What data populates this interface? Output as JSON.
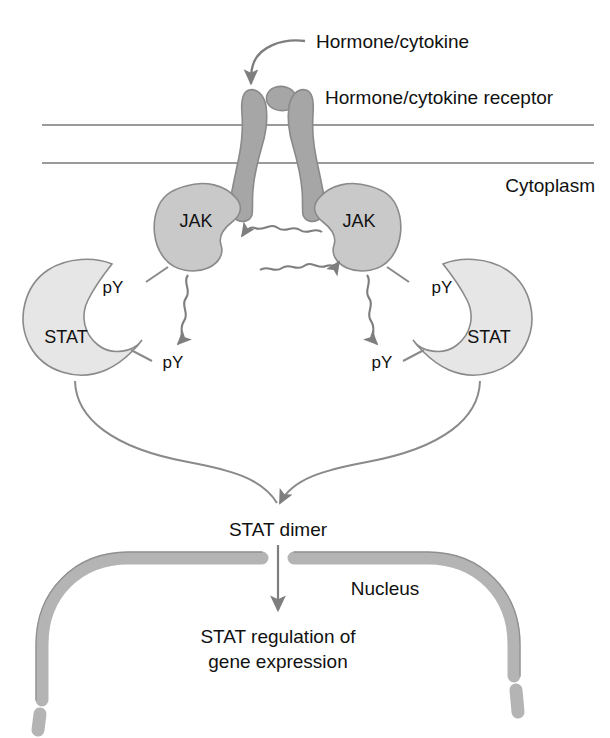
{
  "figure": {
    "background_color": "#ffffff"
  },
  "labels": {
    "ligand": "Hormone/cytokine",
    "receptor": "Hormone/cytokine receptor",
    "cytoplasm": "Cytoplasm",
    "nucleus": "Nucleus",
    "stat_dimer": "STAT dimer",
    "gene_expression_line1": "STAT regulation of",
    "gene_expression_line2": "gene expression"
  },
  "shapes": {
    "jak_left_label": "JAK",
    "jak_right_label": "JAK",
    "stat_left_label": "STAT",
    "stat_right_label": "STAT"
  },
  "phospho": {
    "jak_left_py": "pY",
    "stat_left_py": "pY",
    "jak_right_py": "pY",
    "stat_right_py": "pY"
  },
  "colors": {
    "receptor_fill": "#a6a6a6",
    "ligand_fill": "#a6a6a6",
    "jak_fill": "#c9c9c9",
    "stat_fill": "#e6e6e6",
    "nucleus_fill": "#b4b4b4",
    "outline": "#8a8a8a",
    "membrane": "#9a9a9a",
    "arrow": "#7e7e7e",
    "text": "#111111"
  },
  "geometry": {
    "canvas_width": 610,
    "canvas_height": 738,
    "membrane_line_top_y": 125,
    "membrane_line_bottom_y": 163,
    "membrane_line_x_start": 42,
    "membrane_line_x_end": 594
  }
}
